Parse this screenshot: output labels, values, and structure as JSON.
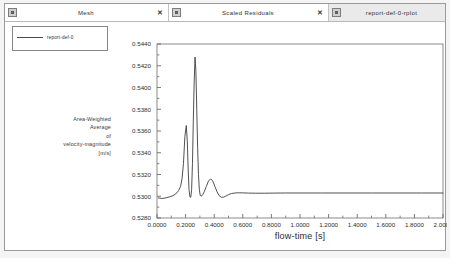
{
  "window": {
    "title": "report-def-0-rplot"
  },
  "tabs": [
    {
      "label": "Mesh",
      "icon": "window-icon",
      "close_label": "✕",
      "active": false,
      "closable": true
    },
    {
      "label": "Scaled Residuals",
      "icon": "window-icon",
      "close_label": "✕",
      "active": false,
      "closable": true
    },
    {
      "label": "report-def-0-rplot",
      "icon": "window-icon",
      "close_label": "",
      "active": true,
      "closable": false
    }
  ],
  "legend": {
    "entries": [
      {
        "label": "report-def-0",
        "color": "#4a4a4a"
      }
    ]
  },
  "y_caption": {
    "lines": [
      "Area-Weighted",
      "Average",
      "of",
      "velocity-magnitude",
      "[m/s]"
    ]
  },
  "colors": {
    "curve": "#3d3d3d",
    "axis": "#5a5a5a",
    "frame": "#6e6e6e",
    "text": "#2e2e2e",
    "background": "#ffffff",
    "tab_active_bg": "#eaeaea"
  },
  "chart_data": {
    "type": "line",
    "title": "",
    "xlabel": "flow-time [s]",
    "ylabel": "Area-Weighted Average of velocity-magnitude [m/s]",
    "xlim": [
      0.0,
      2.0
    ],
    "ylim": [
      0.528,
      0.544
    ],
    "xticks": [
      0.0,
      0.2,
      0.4,
      0.6,
      0.8,
      1.0,
      1.2,
      1.4,
      1.6,
      1.8,
      2.0
    ],
    "xtick_labels": [
      "0.0000",
      "0.2000",
      "0.4000",
      "0.6000",
      "0.8000",
      "1.0000",
      "1.2000",
      "1.4000",
      "1.6000",
      "1.8000",
      "2.0000"
    ],
    "yticks": [
      0.528,
      0.53,
      0.532,
      0.534,
      0.536,
      0.538,
      0.54,
      0.542,
      0.544
    ],
    "ytick_labels": [
      "0.5280",
      "0.5300",
      "0.5320",
      "0.5340",
      "0.5360",
      "0.5380",
      "0.5400",
      "0.5420",
      "0.5440"
    ],
    "xminor_per_major": 2,
    "yminor_per_major": 2,
    "grid": false,
    "legend_position": "top-left-outside",
    "series": [
      {
        "name": "report-def-0",
        "color": "#3d3d3d",
        "x": [
          0.01,
          0.03,
          0.05,
          0.07,
          0.09,
          0.11,
          0.13,
          0.15,
          0.165,
          0.175,
          0.185,
          0.195,
          0.205,
          0.212,
          0.218,
          0.224,
          0.23,
          0.236,
          0.242,
          0.248,
          0.254,
          0.26,
          0.266,
          0.272,
          0.278,
          0.284,
          0.29,
          0.296,
          0.302,
          0.308,
          0.314,
          0.32,
          0.33,
          0.345,
          0.36,
          0.375,
          0.39,
          0.405,
          0.42,
          0.435,
          0.45,
          0.465,
          0.48,
          0.5,
          0.52,
          0.545,
          0.57,
          0.6,
          0.64,
          0.69,
          0.75,
          0.82,
          0.9,
          1.0,
          1.15,
          1.3,
          1.5,
          1.7,
          1.85,
          2.0
        ],
        "y": [
          0.52985,
          0.5298,
          0.52982,
          0.52988,
          0.52995,
          0.53005,
          0.5302,
          0.5305,
          0.5309,
          0.5316,
          0.533,
          0.5355,
          0.5365,
          0.535,
          0.5325,
          0.5306,
          0.52995,
          0.5299,
          0.5306,
          0.533,
          0.537,
          0.5405,
          0.5428,
          0.5415,
          0.538,
          0.5345,
          0.532,
          0.5306,
          0.5301,
          0.53,
          0.53005,
          0.53015,
          0.5304,
          0.5309,
          0.5314,
          0.5316,
          0.5314,
          0.5309,
          0.5304,
          0.53005,
          0.5299,
          0.52992,
          0.53,
          0.53015,
          0.53025,
          0.5303,
          0.53032,
          0.53031,
          0.53029,
          0.53028,
          0.53028,
          0.53029,
          0.5303,
          0.5303,
          0.5303,
          0.5303,
          0.5303,
          0.5303,
          0.5303,
          0.5303
        ]
      }
    ]
  }
}
